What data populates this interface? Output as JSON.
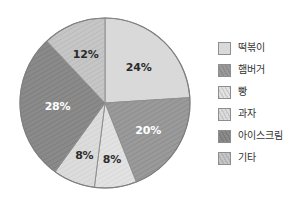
{
  "chart_data": {
    "type": "pie",
    "title": "",
    "categories": [
      "떡볶이",
      "햄버거",
      "빵",
      "과자",
      "아이스크림",
      "기타"
    ],
    "values": [
      24,
      20,
      8,
      8,
      28,
      12
    ],
    "value_labels": [
      "24%",
      "20%",
      "8%",
      "8%",
      "28%",
      "12%"
    ],
    "unit": "%",
    "total": 100,
    "legend_position": "right",
    "grid": false,
    "start_angle_deg": 0,
    "direction": "clockwise",
    "colors": [
      "#d9d9d9",
      "#9a9a9a",
      "#e2e2e2",
      "#dcdcdc",
      "#8a8a8a",
      "#c6c6c6"
    ],
    "patterns": [
      "solid",
      "diagonal-hatch",
      "diagonal-hatch",
      "diagonal-hatch",
      "diagonal-hatch",
      "diagonal-hatch"
    ],
    "label_colors": [
      "dark",
      "light",
      "dark",
      "dark",
      "light",
      "dark"
    ]
  },
  "legend": {
    "items": [
      {
        "label": "떡볶이",
        "value_label": "24%"
      },
      {
        "label": "햄버거",
        "value_label": "20%"
      },
      {
        "label": "빵",
        "value_label": "8%"
      },
      {
        "label": "과자",
        "value_label": "8%"
      },
      {
        "label": "아이스크림",
        "value_label": "28%"
      },
      {
        "label": "기타",
        "value_label": "12%"
      }
    ]
  },
  "slice_labels": {
    "s0": "24%",
    "s1": "20%",
    "s2": "8%",
    "s3": "8%",
    "s4": "28%",
    "s5": "12%"
  },
  "icons": {
    "swatch": "color-swatch-icon"
  }
}
